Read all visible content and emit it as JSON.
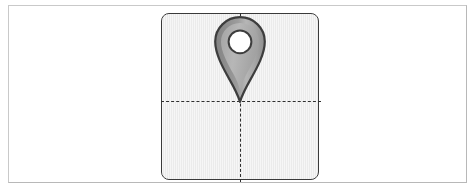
{
  "canvas": {
    "title": "Map Pin Placement Canvas",
    "artboard_label": "artboard",
    "background_color": "#ebebeb",
    "border_color": "#3a3a3a",
    "corner_radius": "8px",
    "width": 158,
    "height": 167
  },
  "frame": {
    "label": "outer frame",
    "border_color": "#c9c9c9",
    "background_color": "#ffffff"
  },
  "guides": {
    "horizontal": {
      "label": "horizontal center guide",
      "style": "dashed",
      "color": "#2e2e2e",
      "position_y": 87
    },
    "vertical": {
      "label": "vertical center guide",
      "style": "dashed",
      "color": "#2e2e2e",
      "position_x": 78
    }
  },
  "marker": {
    "icon": "map-pin-icon",
    "label": "map pin marker",
    "outline_color": "#3d3d3d",
    "body_color": "#9a9a9a",
    "highlight_color": "#b5b5b5",
    "shadow_color": "#7e7e7e",
    "hole_color": "#ffffff",
    "anchor_x": 78,
    "anchor_y": 87
  }
}
